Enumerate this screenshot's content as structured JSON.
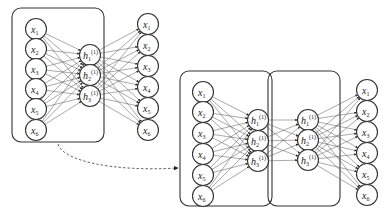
{
  "diagram": {
    "type": "stacked-autoencoder",
    "colors": {
      "stroke": "#333333",
      "edge": "#555555",
      "background": "#ffffff"
    },
    "autoencoder_1": {
      "inputs": [
        {
          "base": "x",
          "sub": "1"
        },
        {
          "base": "x",
          "sub": "2"
        },
        {
          "base": "x",
          "sub": "3"
        },
        {
          "base": "x",
          "sub": "4"
        },
        {
          "base": "x",
          "sub": "5"
        },
        {
          "base": "x",
          "sub": "6"
        }
      ],
      "hidden": [
        {
          "base": "h",
          "sub": "1",
          "sup": "(1)"
        },
        {
          "base": "h",
          "sub": "2",
          "sup": "(1)"
        },
        {
          "base": "h",
          "sub": "3",
          "sup": "(1)"
        }
      ],
      "outputs": [
        {
          "base": "x",
          "sub": "1"
        },
        {
          "base": "x",
          "sub": "2"
        },
        {
          "base": "x",
          "sub": "3"
        },
        {
          "base": "x",
          "sub": "4"
        },
        {
          "base": "x",
          "sub": "5"
        },
        {
          "base": "x",
          "sub": "6"
        }
      ]
    },
    "autoencoder_2": {
      "inputs": [
        {
          "base": "x",
          "sub": "1"
        },
        {
          "base": "x",
          "sub": "2"
        },
        {
          "base": "x",
          "sub": "3"
        },
        {
          "base": "x",
          "sub": "4"
        },
        {
          "base": "x",
          "sub": "5"
        },
        {
          "base": "x",
          "sub": "6"
        }
      ],
      "hidden_1": [
        {
          "base": "h",
          "sub": "1",
          "sup": "(1)"
        },
        {
          "base": "h",
          "sub": "2",
          "sup": "(1)"
        },
        {
          "base": "h",
          "sub": "3",
          "sup": "(1)"
        }
      ],
      "hidden_2": [
        {
          "base": "h",
          "sub": "1",
          "sup": "(1)"
        },
        {
          "base": "h",
          "sub": "2",
          "sup": "(1)"
        },
        {
          "base": "h",
          "sub": "3",
          "sup": "(1)"
        }
      ],
      "outputs": [
        {
          "base": "x",
          "sub": "1"
        },
        {
          "base": "x",
          "sub": "2"
        },
        {
          "base": "x",
          "sub": "3"
        },
        {
          "base": "x",
          "sub": "4"
        },
        {
          "base": "x",
          "sub": "5"
        },
        {
          "base": "x",
          "sub": "6"
        }
      ]
    },
    "transfer_arrow": "dashed"
  }
}
